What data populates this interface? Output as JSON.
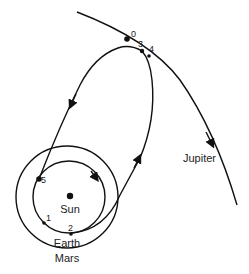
{
  "diagram": {
    "bodies": {
      "sun": "Sun",
      "earth": "Earth",
      "mars": "Mars",
      "jupiter": "Jupiter"
    },
    "points": [
      "0",
      "1",
      "2",
      "3",
      "4",
      "5"
    ],
    "colors": {
      "line": "#111111",
      "text": "#222222",
      "background": "#ffffff"
    }
  }
}
